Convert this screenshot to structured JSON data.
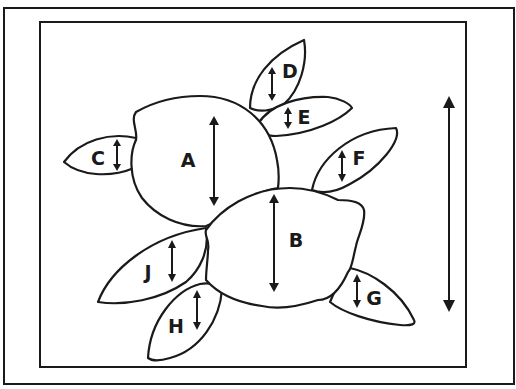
{
  "diagram": {
    "colors": {
      "ink": "#1a1a1a",
      "background": "#ffffff"
    },
    "fruits": [
      {
        "id": "A",
        "label": "A",
        "type": "lemon"
      },
      {
        "id": "B",
        "label": "B",
        "type": "lemon"
      }
    ],
    "leaves": [
      {
        "id": "C",
        "label": "C"
      },
      {
        "id": "D",
        "label": "D"
      },
      {
        "id": "E",
        "label": "E"
      },
      {
        "id": "F",
        "label": "F"
      },
      {
        "id": "G",
        "label": "G"
      },
      {
        "id": "H",
        "label": "H"
      },
      {
        "id": "J",
        "label": "J"
      }
    ],
    "overall_arrow": {
      "meaning": "overall-height",
      "direction": "vertical-double-headed"
    }
  }
}
